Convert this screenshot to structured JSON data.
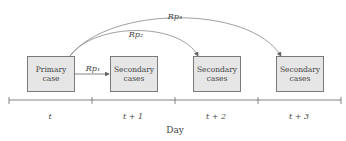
{
  "diagram": {
    "nodes": [
      {
        "id": "primary",
        "line1": "Primary",
        "line2": "case"
      },
      {
        "id": "secondary1",
        "line1": "Secondary",
        "line2": "cases"
      },
      {
        "id": "secondary2",
        "line1": "Secondary",
        "line2": "cases"
      },
      {
        "id": "secondary3",
        "line1": "Secondary",
        "line2": "cases"
      }
    ],
    "edges": [
      {
        "from": "primary",
        "to": "secondary1",
        "label": "Rp₁"
      },
      {
        "from": "primary",
        "to": "secondary2",
        "label": "Rp₂"
      },
      {
        "from": "primary",
        "to": "secondary3",
        "label": "Rp₃"
      }
    ],
    "axis": {
      "title": "Day",
      "ticks": [
        "t",
        "t + 1",
        "t + 2",
        "t + 3"
      ]
    }
  },
  "colors": {
    "box_fill": "#e6e6e6",
    "box_border": "#7a7a7a",
    "line": "#888888"
  }
}
